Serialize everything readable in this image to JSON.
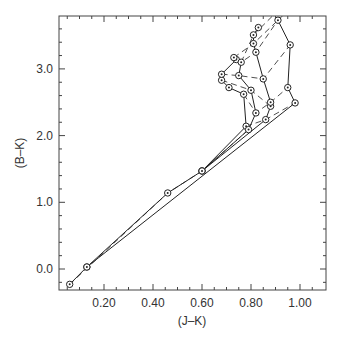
{
  "chart_data": {
    "type": "line",
    "title": "",
    "xlabel": "(J–K)",
    "ylabel": "(B–K)",
    "xlim": [
      0.02,
      1.1
    ],
    "ylim": [
      -0.3,
      3.8
    ],
    "x_ticks": [
      "0.20",
      "0.40",
      "0.60",
      "0.80",
      "1.00"
    ],
    "x_tick_values": [
      0.2,
      0.4,
      0.6,
      0.8,
      1.0
    ],
    "y_ticks": [
      "0.0",
      "1.0",
      "2.0",
      "3.0"
    ],
    "y_tick_values": [
      0.0,
      1.0,
      2.0,
      3.0
    ],
    "grid": false,
    "legend": null,
    "marker": "circle-with-dot",
    "series": [
      {
        "name": "track-a",
        "style": "solid",
        "points": [
          [
            0.06,
            -0.23
          ],
          [
            0.13,
            0.03
          ],
          [
            0.46,
            1.14
          ],
          [
            0.6,
            1.47
          ],
          [
            0.78,
            2.14
          ],
          [
            0.77,
            2.62
          ],
          [
            0.71,
            2.72
          ],
          [
            0.68,
            2.83
          ],
          [
            0.68,
            2.92
          ],
          [
            0.74,
            3.14
          ],
          [
            0.73,
            3.17
          ]
        ]
      },
      {
        "name": "track-b",
        "style": "solid",
        "points": [
          [
            0.6,
            1.47
          ],
          [
            0.79,
            2.09
          ],
          [
            0.82,
            2.34
          ],
          [
            0.8,
            2.68
          ],
          [
            0.75,
            2.9
          ],
          [
            0.76,
            3.1
          ]
        ]
      },
      {
        "name": "track-c",
        "style": "solid",
        "points": [
          [
            0.6,
            1.47
          ],
          [
            0.86,
            2.24
          ],
          [
            0.88,
            2.44
          ],
          [
            0.88,
            2.5
          ],
          [
            0.85,
            2.85
          ],
          [
            0.82,
            3.25
          ],
          [
            0.81,
            3.38
          ],
          [
            0.81,
            3.51
          ],
          [
            0.83,
            3.62
          ]
        ]
      },
      {
        "name": "track-d",
        "style": "solid",
        "points": [
          [
            0.13,
            0.03
          ],
          [
            0.98,
            2.49
          ],
          [
            0.95,
            2.72
          ],
          [
            0.96,
            3.36
          ],
          [
            0.91,
            3.73
          ]
        ]
      },
      {
        "name": "isochrone-1",
        "style": "dashed",
        "points": [
          [
            0.06,
            -0.23
          ],
          [
            0.46,
            1.14
          ],
          [
            0.6,
            1.47
          ],
          [
            0.79,
            2.09
          ]
        ]
      },
      {
        "name": "isochrone-2",
        "style": "dashed",
        "points": [
          [
            0.78,
            2.14
          ],
          [
            0.86,
            2.24
          ],
          [
            0.98,
            2.49
          ]
        ]
      },
      {
        "name": "isochrone-3",
        "style": "dashed",
        "points": [
          [
            0.77,
            2.62
          ],
          [
            0.82,
            2.34
          ],
          [
            0.88,
            2.5
          ],
          [
            0.95,
            2.72
          ]
        ]
      },
      {
        "name": "isochrone-4",
        "style": "dashed",
        "points": [
          [
            0.68,
            2.83
          ],
          [
            0.8,
            2.68
          ],
          [
            0.88,
            2.44
          ]
        ]
      },
      {
        "name": "isochrone-5",
        "style": "dashed",
        "points": [
          [
            0.68,
            2.92
          ],
          [
            0.75,
            2.9
          ],
          [
            0.85,
            2.85
          ],
          [
            0.96,
            3.36
          ]
        ]
      },
      {
        "name": "isochrone-6",
        "style": "dashed",
        "points": [
          [
            0.74,
            3.14
          ],
          [
            0.76,
            3.1
          ],
          [
            0.82,
            3.25
          ],
          [
            0.91,
            3.73
          ]
        ]
      },
      {
        "name": "isochrone-7",
        "style": "dashed",
        "points": [
          [
            0.73,
            3.17
          ],
          [
            0.81,
            3.38
          ],
          [
            0.93,
            3.8
          ]
        ]
      },
      {
        "name": "isochrone-8",
        "style": "dashed",
        "points": [
          [
            0.76,
            3.1
          ],
          [
            0.81,
            3.51
          ],
          [
            0.89,
            3.8
          ]
        ]
      }
    ]
  }
}
